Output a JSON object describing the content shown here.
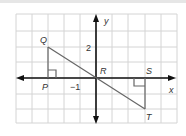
{
  "diagram": {
    "type": "coordinate-grid",
    "axes": {
      "x_label": "x",
      "y_label": "y"
    },
    "tick_labels": {
      "y_tick": "2",
      "x_tick": "−1"
    },
    "points": {
      "Q": {
        "label": "Q",
        "coord": [
          -3,
          2
        ]
      },
      "P": {
        "label": "P",
        "coord": [
          -3,
          0
        ]
      },
      "R": {
        "label": "R",
        "coord": [
          0,
          0
        ]
      },
      "S": {
        "label": "S",
        "coord": [
          3,
          0
        ]
      },
      "T": {
        "label": "T",
        "coord": [
          3,
          -2
        ]
      }
    },
    "segments": [
      "QT",
      "QP",
      "ST"
    ],
    "right_angles": [
      "P",
      "S"
    ],
    "colors": {
      "grid": "#d0d0d0",
      "axes": "#111111",
      "lines": "#666666"
    }
  }
}
